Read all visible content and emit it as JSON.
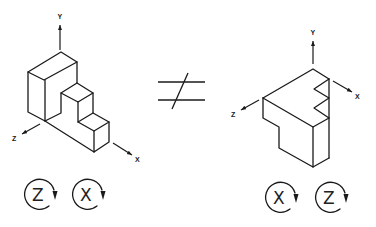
{
  "diagram": {
    "left_object": {
      "axes": {
        "y_label": "Y",
        "x_label": "X",
        "z_label": "Z"
      },
      "rotations": [
        {
          "axis": "Z",
          "direction": "clockwise"
        },
        {
          "axis": "X",
          "direction": "clockwise"
        }
      ]
    },
    "relation_symbol": "not-equal",
    "right_object": {
      "axes": {
        "y_label": "Y",
        "x_label": "X",
        "z_label": "Z"
      },
      "rotations": [
        {
          "axis": "X",
          "direction": "clockwise"
        },
        {
          "axis": "Z",
          "direction": "clockwise"
        }
      ]
    },
    "colors": {
      "line": "#1a1a1a",
      "background": "#ffffff"
    }
  }
}
